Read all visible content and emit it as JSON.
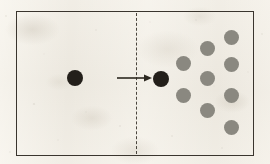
{
  "figure": {
    "kind": "scientific-diagram",
    "width": 270,
    "height": 164,
    "background_color": "#ece8df"
  },
  "frame": {
    "name": "outer-rectangle",
    "x": 16,
    "y": 11,
    "width": 238,
    "height": 145,
    "stroke_color": "#3a352e",
    "stroke_width": 1.5
  },
  "divider": {
    "name": "dashed-boundary-line",
    "x": 136,
    "y_top": 13,
    "y_bottom": 154,
    "stroke_color": "#4a453d",
    "stroke_width": 1.4,
    "dash": "5 4"
  },
  "arrow": {
    "name": "motion-arrow",
    "x_start": 117,
    "x_end": 152,
    "y": 78,
    "stroke_color": "#2c2820",
    "stroke_width": 1.6,
    "head_length": 8,
    "head_width": 7
  },
  "colors": {
    "black_particle": "#231f1a",
    "gray_particle": "#8a8880",
    "frame_stroke": "#3a352e",
    "paper": "#ece8df"
  },
  "black_particles": [
    {
      "label": "incoming-particle",
      "cx": 75,
      "cy": 78,
      "r": 8.0
    },
    {
      "label": "transmitted-particle",
      "cx": 161,
      "cy": 79,
      "r": 8.0
    }
  ],
  "gray_particles": [
    {
      "label": "gray-col1-top",
      "cx": 183,
      "cy": 63,
      "r": 7.5
    },
    {
      "label": "gray-col1-bottom",
      "cx": 183,
      "cy": 95,
      "r": 7.5
    },
    {
      "label": "gray-col2-top",
      "cx": 207,
      "cy": 48,
      "r": 7.5
    },
    {
      "label": "gray-col2-middle",
      "cx": 207,
      "cy": 78,
      "r": 7.5
    },
    {
      "label": "gray-col2-bottom",
      "cx": 207,
      "cy": 110,
      "r": 7.5
    },
    {
      "label": "gray-col3-1",
      "cx": 231,
      "cy": 37,
      "r": 7.5
    },
    {
      "label": "gray-col3-2",
      "cx": 231,
      "cy": 64,
      "r": 7.5
    },
    {
      "label": "gray-col3-3",
      "cx": 231,
      "cy": 95,
      "r": 7.5
    },
    {
      "label": "gray-col3-4",
      "cx": 231,
      "cy": 127,
      "r": 7.5
    }
  ],
  "speckles": [
    {
      "cx": 6,
      "cy": 16,
      "r": 0.9,
      "o": 0.3
    },
    {
      "cx": 34,
      "cy": 104,
      "r": 1.1,
      "o": 0.34
    },
    {
      "cx": 58,
      "cy": 140,
      "r": 0.8,
      "o": 0.26
    },
    {
      "cx": 96,
      "cy": 30,
      "r": 0.9,
      "o": 0.24
    },
    {
      "cx": 120,
      "cy": 126,
      "r": 1.0,
      "o": 0.28
    },
    {
      "cx": 150,
      "cy": 22,
      "r": 0.8,
      "o": 0.22
    },
    {
      "cx": 172,
      "cy": 136,
      "r": 1.0,
      "o": 0.26
    },
    {
      "cx": 196,
      "cy": 20,
      "r": 0.9,
      "o": 0.22
    },
    {
      "cx": 222,
      "cy": 148,
      "r": 0.9,
      "o": 0.24
    },
    {
      "cx": 248,
      "cy": 72,
      "r": 0.8,
      "o": 0.22
    },
    {
      "cx": 262,
      "cy": 34,
      "r": 1.0,
      "o": 0.26
    },
    {
      "cx": 10,
      "cy": 152,
      "r": 0.9,
      "o": 0.24
    },
    {
      "cx": 44,
      "cy": 54,
      "r": 0.7,
      "o": 0.2
    },
    {
      "cx": 86,
      "cy": 112,
      "r": 0.8,
      "o": 0.22
    },
    {
      "cx": 134,
      "cy": 60,
      "r": 0.7,
      "o": 0.18
    },
    {
      "cx": 214,
      "cy": 86,
      "r": 0.7,
      "o": 0.18
    }
  ]
}
